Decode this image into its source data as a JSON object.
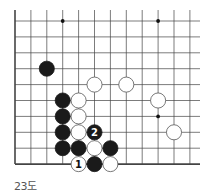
{
  "diagram": {
    "caption": "23도",
    "grid": {
      "origin_x": 15,
      "origin_y": 21,
      "spacing": 15.9,
      "columns": 12,
      "rows": 10,
      "line_extent_right": 200,
      "left_edge": true,
      "bottom_edge": true
    },
    "colors": {
      "line": "#444444",
      "black_stone": "#1a1a1a",
      "white_stone": "#ffffff",
      "white_stroke": "#555555",
      "caption": "#555555"
    },
    "star_points": [
      {
        "col": 3,
        "row": 0
      },
      {
        "col": 9,
        "row": 0
      },
      {
        "col": 9,
        "row": 6
      }
    ],
    "stones": [
      {
        "color": "black",
        "col": 2,
        "row": 3
      },
      {
        "color": "white",
        "col": 5,
        "row": 4
      },
      {
        "color": "white",
        "col": 7,
        "row": 4
      },
      {
        "color": "black",
        "col": 3,
        "row": 5
      },
      {
        "color": "white",
        "col": 4,
        "row": 5
      },
      {
        "color": "white",
        "col": 9,
        "row": 5
      },
      {
        "color": "black",
        "col": 3,
        "row": 6
      },
      {
        "color": "white",
        "col": 4,
        "row": 6
      },
      {
        "color": "black",
        "col": 3,
        "row": 7
      },
      {
        "color": "white",
        "col": 4,
        "row": 7
      },
      {
        "color": "black",
        "col": 5,
        "row": 7,
        "label": "2"
      },
      {
        "color": "white",
        "col": 10,
        "row": 7
      },
      {
        "color": "black",
        "col": 3,
        "row": 8
      },
      {
        "color": "black",
        "col": 4,
        "row": 8
      },
      {
        "color": "white",
        "col": 5,
        "row": 8
      },
      {
        "color": "black",
        "col": 6,
        "row": 8
      },
      {
        "color": "white",
        "col": 4,
        "row": 9,
        "label": "1"
      },
      {
        "color": "black",
        "col": 5,
        "row": 9
      },
      {
        "color": "white",
        "col": 6,
        "row": 9
      }
    ]
  }
}
